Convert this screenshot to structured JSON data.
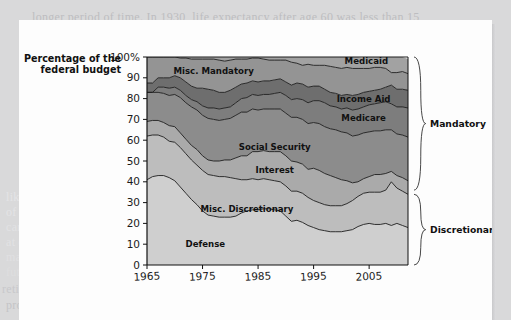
{
  "page_bleed": {
    "lines": [
      "longer period of time. In 1930, life expectancy after age 60 was less than 15",
      "",
      "among the elderly, which had a profound",
      "effect on their standard of living and on th",
      "likelihood of dying at an early age. Mean",
      "of survival to age 65 has risen dramatical",
      "care of retirees. Because of the way Social",
      "at each age. And because people are livin",
      "maintain an elderly population that is lar",
      "future.          Notice how in each decade, fewer and fewer",
      "retirement is either a continual marvel of life or possibly an economic",
      "problem waiting to be solved. To illustrate, consider the chart above"
    ]
  },
  "chart_data": {
    "type": "area",
    "title": "",
    "xlabel": "",
    "ylabel": "Percentage of the federal budget",
    "xlim": [
      1965,
      2012
    ],
    "ylim": [
      0,
      100
    ],
    "grid": false,
    "legend_position": "inline-labels",
    "y_ticks": [
      "0",
      "10",
      "20",
      "30",
      "40",
      "50",
      "60",
      "70",
      "80",
      "90",
      "100%"
    ],
    "y_tick_values": [
      0,
      10,
      20,
      30,
      40,
      50,
      60,
      70,
      80,
      90,
      100
    ],
    "x_ticks": [
      "1965",
      "1975",
      "1985",
      "1995",
      "2005"
    ],
    "x_tick_values": [
      1965,
      1975,
      1985,
      1995,
      2005
    ],
    "x": [
      1965,
      1966,
      1967,
      1968,
      1969,
      1970,
      1971,
      1972,
      1973,
      1974,
      1975,
      1976,
      1977,
      1978,
      1979,
      1980,
      1981,
      1982,
      1983,
      1984,
      1985,
      1986,
      1987,
      1988,
      1989,
      1990,
      1991,
      1992,
      1993,
      1994,
      1995,
      1996,
      1997,
      1998,
      1999,
      2000,
      2001,
      2002,
      2003,
      2004,
      2005,
      2006,
      2007,
      2008,
      2009,
      2010,
      2011,
      2012
    ],
    "stack_order_bottom_to_top": [
      "Defense",
      "Misc. Discretionary",
      "Interest",
      "Social Security",
      "Medicare",
      "Income Aid",
      "Misc. Mandatory",
      "Medicaid"
    ],
    "series": [
      {
        "name": "Defense",
        "group": "Discretionary",
        "color": "#cfcfcf",
        "label": "Defense",
        "label_x": 1975.5,
        "label_y": 8.5,
        "values": [
          41.0,
          42.5,
          43.0,
          43.0,
          42.0,
          40.5,
          37.5,
          34.5,
          31.5,
          29.0,
          26.0,
          24.0,
          23.5,
          23.0,
          23.0,
          23.0,
          23.5,
          25.0,
          26.0,
          26.5,
          26.5,
          27.0,
          27.0,
          26.5,
          26.0,
          23.5,
          21.0,
          21.5,
          20.5,
          19.0,
          18.0,
          17.0,
          16.5,
          16.0,
          16.0,
          16.0,
          16.5,
          17.0,
          18.5,
          19.5,
          20.0,
          19.5,
          19.5,
          20.0,
          19.0,
          20.0,
          19.0,
          18.0
        ]
      },
      {
        "name": "Misc. Discretionary",
        "group": "Discretionary",
        "color": "#bdbdbd",
        "label": "Misc. Discretionary",
        "label_x": 1983.0,
        "label_y": 25.5,
        "values": [
          21.0,
          20.0,
          19.5,
          18.5,
          17.5,
          18.5,
          19.0,
          19.0,
          19.0,
          19.0,
          19.5,
          19.5,
          19.5,
          19.5,
          19.5,
          19.0,
          18.0,
          16.0,
          15.0,
          15.0,
          14.5,
          14.5,
          14.0,
          14.0,
          14.0,
          14.5,
          14.5,
          14.0,
          14.0,
          13.5,
          13.0,
          13.0,
          12.5,
          12.5,
          12.5,
          12.5,
          13.0,
          14.0,
          14.5,
          15.0,
          15.0,
          15.5,
          15.5,
          16.0,
          21.0,
          17.0,
          16.5,
          16.0
        ]
      },
      {
        "name": "Interest",
        "group": "Mandatory",
        "color": "#aaaaaa",
        "label": "Interest",
        "label_x": 1988.0,
        "label_y": 44.0,
        "values": [
          7.0,
          7.0,
          7.0,
          7.0,
          7.5,
          7.5,
          7.0,
          7.0,
          7.0,
          7.5,
          7.0,
          7.0,
          7.0,
          7.5,
          8.0,
          8.5,
          10.0,
          11.5,
          11.5,
          13.0,
          13.5,
          13.5,
          13.5,
          14.0,
          14.5,
          14.5,
          14.5,
          14.0,
          14.0,
          13.5,
          15.5,
          15.5,
          15.0,
          14.5,
          13.5,
          12.5,
          11.0,
          8.5,
          7.0,
          7.0,
          7.5,
          8.5,
          8.5,
          8.0,
          5.0,
          6.0,
          6.5,
          6.5
        ]
      },
      {
        "name": "Social Security",
        "group": "Mandatory",
        "color": "#8c8c8c",
        "label": "Social Security",
        "label_x": 1988.0,
        "label_y": 55.5,
        "values": [
          14.0,
          13.5,
          13.5,
          14.0,
          14.5,
          15.5,
          17.0,
          17.5,
          18.5,
          19.0,
          19.5,
          20.0,
          20.0,
          19.5,
          19.5,
          20.0,
          20.5,
          21.0,
          21.0,
          20.5,
          20.0,
          20.0,
          20.5,
          20.5,
          20.5,
          20.5,
          21.0,
          21.5,
          21.5,
          22.0,
          22.0,
          22.5,
          22.5,
          22.5,
          23.0,
          23.0,
          23.0,
          22.5,
          22.5,
          22.0,
          21.5,
          21.0,
          21.0,
          21.0,
          20.0,
          20.0,
          20.5,
          21.0
        ]
      },
      {
        "name": "Medicare",
        "group": "Mandatory",
        "color": "#7d7d7d",
        "label": "Medicare",
        "label_x": 2004.0,
        "label_y": 69.0,
        "values": [
          0.0,
          0.0,
          2.5,
          3.0,
          3.5,
          3.5,
          3.5,
          3.5,
          3.5,
          4.0,
          4.5,
          5.0,
          5.5,
          5.5,
          5.5,
          5.5,
          6.0,
          6.5,
          7.0,
          7.0,
          7.0,
          7.0,
          7.0,
          7.5,
          8.0,
          8.5,
          8.5,
          9.0,
          9.5,
          10.0,
          10.5,
          11.0,
          11.5,
          11.0,
          11.0,
          11.0,
          12.0,
          12.5,
          12.5,
          12.5,
          13.0,
          13.0,
          13.5,
          13.5,
          12.5,
          13.0,
          13.5,
          14.0
        ]
      },
      {
        "name": "Income Aid",
        "group": "Mandatory",
        "color": "#6e6e6e",
        "label": "Income Aid",
        "label_x": 2004.0,
        "label_y": 78.5,
        "values": [
          4.5,
          4.5,
          4.5,
          4.5,
          5.0,
          5.5,
          6.0,
          6.5,
          6.5,
          6.5,
          8.5,
          9.0,
          8.5,
          8.0,
          7.5,
          8.0,
          7.5,
          7.0,
          7.0,
          6.5,
          6.5,
          6.5,
          6.5,
          6.5,
          6.5,
          6.5,
          7.0,
          7.5,
          7.5,
          7.5,
          7.0,
          7.0,
          6.5,
          6.5,
          6.5,
          6.5,
          6.5,
          7.0,
          7.0,
          7.0,
          6.5,
          6.5,
          6.5,
          7.0,
          9.0,
          8.5,
          8.5,
          8.5
        ]
      },
      {
        "name": "Misc. Mandatory",
        "group": "Mandatory",
        "color": "#949494",
        "label": "Misc. Mandatory",
        "label_x": 1977.0,
        "label_y": 92.0,
        "values": [
          12.5,
          12.5,
          10.0,
          10.0,
          10.0,
          9.0,
          9.5,
          11.5,
          13.0,
          14.0,
          14.0,
          14.5,
          15.0,
          15.5,
          15.0,
          14.5,
          13.5,
          12.0,
          11.5,
          11.0,
          11.5,
          10.5,
          10.0,
          9.5,
          9.0,
          10.5,
          11.0,
          9.5,
          9.0,
          11.0,
          10.0,
          10.0,
          11.5,
          12.5,
          12.5,
          13.0,
          13.0,
          13.0,
          12.5,
          11.5,
          11.0,
          11.0,
          10.5,
          9.0,
          6.0,
          8.0,
          8.5,
          8.0
        ]
      },
      {
        "name": "Medicaid",
        "group": "Mandatory",
        "color": "#a2a2a2",
        "label": "Medicaid",
        "label_x": 2004.5,
        "label_y": 96.5,
        "values": [
          0.0,
          0.0,
          0.0,
          0.0,
          0.0,
          0.0,
          0.5,
          0.5,
          1.0,
          1.0,
          1.0,
          1.0,
          1.0,
          1.5,
          2.0,
          1.5,
          1.0,
          1.0,
          1.0,
          0.5,
          0.5,
          1.0,
          1.5,
          1.5,
          1.5,
          1.5,
          2.5,
          3.0,
          4.0,
          3.5,
          4.0,
          4.0,
          5.0,
          4.5,
          5.0,
          5.5,
          5.0,
          5.5,
          5.5,
          5.0,
          5.5,
          5.0,
          5.0,
          5.5,
          7.5,
          7.5,
          7.0,
          7.0
        ]
      }
    ],
    "braces": [
      {
        "name": "Mandatory",
        "label": "Mandatory",
        "from_pct": 36,
        "to_pct": 100
      },
      {
        "name": "Discretionary",
        "label": "Discretionary",
        "from_pct": 0,
        "to_pct": 34
      }
    ]
  }
}
